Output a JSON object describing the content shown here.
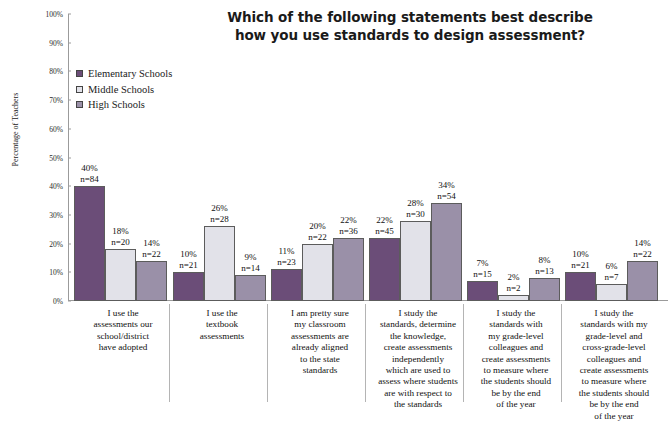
{
  "chart_data": {
    "type": "bar",
    "title": "Which of the following statements best describe how you use standards to design assessment?",
    "title_lines": [
      "Which of the following statements best describe",
      "how you use standards to design assessment?"
    ],
    "xlabel": "",
    "ylabel": "Percentage of Teachers",
    "ylim": [
      0,
      100
    ],
    "ytick_labels": [
      "0%",
      "10%",
      "20%",
      "30%",
      "40%",
      "50%",
      "60%",
      "70%",
      "80%",
      "90%",
      "100%"
    ],
    "ytick_values": [
      0,
      10,
      20,
      30,
      40,
      50,
      60,
      70,
      80,
      90,
      100
    ],
    "grid": false,
    "legend_position": "upper-left-inside",
    "categories": [
      "I use the assessments our school/district have adopted",
      "I use the textbook assessments",
      "I am pretty sure my classroom assessments are already aligned to the state standards",
      "I study the standards, determine the knowledge, create assessments independently which are used to assess where students are with respect to the standards",
      "I study the standards with my grade-level colleagues and create assessments to measure where the students should be by the end of the year",
      "I study the standards with my grade-level and cross-grade-level colleagues and create assessments to measure where the students should be by the end of the year"
    ],
    "category_lines": [
      [
        "I use the",
        "assessments our",
        "school/district",
        "have adopted"
      ],
      [
        "I use the",
        "textbook",
        "assessments"
      ],
      [
        "I am pretty sure",
        "my classroom",
        "assessments are",
        "already aligned",
        "to the state",
        "standards"
      ],
      [
        "I study the",
        "standards, determine",
        "the knowledge,",
        "create assessments",
        "independently",
        "which are used to",
        "assess where students",
        "are with respect to",
        "the standards"
      ],
      [
        "I study the",
        "standards with",
        "my grade-level",
        "colleagues and",
        "create assessments",
        "to measure where",
        "the students should",
        "be by the end",
        "of the year"
      ],
      [
        "I study the",
        "standards with my",
        "grade-level and",
        "cross-grade-level",
        "colleagues and",
        "create assessments",
        "to measure where",
        "the students should",
        "be by the end",
        "of the year"
      ]
    ],
    "series": [
      {
        "name": "Elementary Schools",
        "color": "#6b4d78",
        "values": [
          40,
          10,
          11,
          22,
          7,
          10
        ],
        "counts": [
          84,
          21,
          23,
          45,
          15,
          21
        ],
        "labels": [
          "40%",
          "10%",
          "11%",
          "22%",
          "7%",
          "10%"
        ],
        "count_labels": [
          "n=84",
          "n=21",
          "n=23",
          "n=45",
          "n=15",
          "n=21"
        ]
      },
      {
        "name": "Middle Schools",
        "color": "#e2e2e9",
        "values": [
          18,
          26,
          20,
          28,
          2,
          6
        ],
        "counts": [
          20,
          28,
          22,
          30,
          2,
          7
        ],
        "labels": [
          "18%",
          "26%",
          "20%",
          "28%",
          "2%",
          "6%"
        ],
        "count_labels": [
          "n=20",
          "n=28",
          "n=22",
          "n=30",
          "n=2",
          "n=7"
        ]
      },
      {
        "name": "High Schools",
        "color": "#9a90a8",
        "values": [
          14,
          9,
          22,
          34,
          8,
          14
        ],
        "counts": [
          22,
          14,
          36,
          54,
          13,
          22
        ],
        "labels": [
          "14%",
          "9%",
          "22%",
          "34%",
          "8%",
          "14%"
        ],
        "count_labels": [
          "n=22",
          "n=14",
          "n=36",
          "n=54",
          "n=13",
          "n=22"
        ]
      }
    ]
  }
}
